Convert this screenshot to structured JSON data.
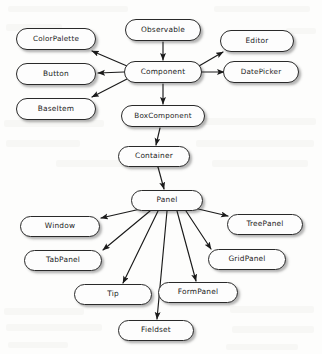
{
  "diagram": {
    "type": "class-hierarchy",
    "background_color": "#fdfdfc",
    "node_fill_color": "#fdfdfd",
    "node_border_color": "#2a2a2a",
    "edge_color": "#1a1a1a",
    "nodes": [
      {
        "id": "observable",
        "label": "Observable",
        "x": 163,
        "y": 30,
        "w": 76,
        "h": 22,
        "font_size": 7.4
      },
      {
        "id": "colorpalette",
        "label": "ColorPalette",
        "x": 56,
        "y": 39,
        "w": 80,
        "h": 22,
        "font_size": 7.2
      },
      {
        "id": "editor",
        "label": "Editor",
        "x": 257,
        "y": 41,
        "w": 74,
        "h": 22,
        "font_size": 7.4
      },
      {
        "id": "component",
        "label": "Component",
        "x": 163,
        "y": 72,
        "w": 78,
        "h": 22,
        "font_size": 7.4
      },
      {
        "id": "button",
        "label": "Button",
        "x": 56,
        "y": 74,
        "w": 80,
        "h": 22,
        "font_size": 7.4
      },
      {
        "id": "datepicker",
        "label": "DatePicker",
        "x": 261,
        "y": 72,
        "w": 76,
        "h": 22,
        "font_size": 7.2
      },
      {
        "id": "baseitem",
        "label": "BaseItem",
        "x": 56,
        "y": 109,
        "w": 80,
        "h": 22,
        "font_size": 7.4
      },
      {
        "id": "boxcomponent",
        "label": "BoxComponent",
        "x": 163,
        "y": 116,
        "w": 84,
        "h": 22,
        "font_size": 7.2
      },
      {
        "id": "container",
        "label": "Container",
        "x": 154,
        "y": 156,
        "w": 72,
        "h": 21,
        "font_size": 7.4
      },
      {
        "id": "panel",
        "label": "Panel",
        "x": 167,
        "y": 200,
        "w": 72,
        "h": 21,
        "font_size": 7.4
      },
      {
        "id": "window",
        "label": "Window",
        "x": 60,
        "y": 226,
        "w": 80,
        "h": 21,
        "font_size": 7.4
      },
      {
        "id": "treepanel",
        "label": "TreePanel",
        "x": 265,
        "y": 224,
        "w": 76,
        "h": 21,
        "font_size": 7.4
      },
      {
        "id": "tabpanel",
        "label": "TabPanel",
        "x": 63,
        "y": 260,
        "w": 78,
        "h": 21,
        "font_size": 7.4
      },
      {
        "id": "gridpanel",
        "label": "GridPanel",
        "x": 247,
        "y": 259,
        "w": 78,
        "h": 21,
        "font_size": 7.4
      },
      {
        "id": "tip",
        "label": "Tip",
        "x": 113,
        "y": 294,
        "w": 78,
        "h": 21,
        "font_size": 7.4
      },
      {
        "id": "formpanel",
        "label": "FormPanel",
        "x": 198,
        "y": 292,
        "w": 80,
        "h": 21,
        "font_size": 7.4
      },
      {
        "id": "fieldset",
        "label": "Fieldset",
        "x": 156,
        "y": 330,
        "w": 76,
        "h": 21,
        "font_size": 7.4
      }
    ],
    "edges": [
      {
        "from": "observable",
        "to": "component",
        "x1": 163,
        "y1": 42,
        "x2": 163,
        "y2": 60
      },
      {
        "from": "component",
        "to": "colorpalette",
        "x1": 127,
        "y1": 66,
        "x2": 92,
        "y2": 51
      },
      {
        "from": "component",
        "to": "button",
        "x1": 124,
        "y1": 72,
        "x2": 98,
        "y2": 73
      },
      {
        "from": "component",
        "to": "baseitem",
        "x1": 127,
        "y1": 79,
        "x2": 92,
        "y2": 97
      },
      {
        "from": "component",
        "to": "editor",
        "x1": 199,
        "y1": 66,
        "x2": 223,
        "y2": 52
      },
      {
        "from": "component",
        "to": "datepicker",
        "x1": 202,
        "y1": 72,
        "x2": 224,
        "y2": 72
      },
      {
        "from": "component",
        "to": "boxcomponent",
        "x1": 163,
        "y1": 84,
        "x2": 163,
        "y2": 104
      },
      {
        "from": "boxcomponent",
        "to": "container",
        "x1": 160,
        "y1": 128,
        "x2": 156,
        "y2": 145
      },
      {
        "from": "container",
        "to": "panel",
        "x1": 158,
        "y1": 167,
        "x2": 164,
        "y2": 189
      },
      {
        "from": "panel",
        "to": "window",
        "x1": 145,
        "y1": 208,
        "x2": 101,
        "y2": 218
      },
      {
        "from": "panel",
        "to": "treepanel",
        "x1": 194,
        "y1": 208,
        "x2": 228,
        "y2": 216
      },
      {
        "from": "panel",
        "to": "tabpanel",
        "x1": 150,
        "y1": 211,
        "x2": 103,
        "y2": 250
      },
      {
        "from": "panel",
        "to": "gridpanel",
        "x1": 186,
        "y1": 211,
        "x2": 211,
        "y2": 249
      },
      {
        "from": "panel",
        "to": "tip",
        "x1": 158,
        "y1": 211,
        "x2": 123,
        "y2": 283
      },
      {
        "from": "panel",
        "to": "formpanel",
        "x1": 177,
        "y1": 211,
        "x2": 196,
        "y2": 281
      },
      {
        "from": "panel",
        "to": "fieldset",
        "x1": 167,
        "y1": 211,
        "x2": 157,
        "y2": 319
      }
    ]
  }
}
